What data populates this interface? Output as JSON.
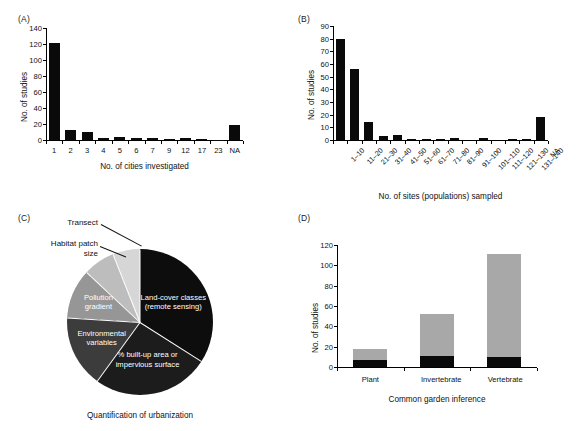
{
  "figure": {
    "panels": [
      "(A)",
      "(B)",
      "(C)",
      "(D)"
    ]
  },
  "chart_data": [
    {
      "panel": "(A)",
      "type": "bar",
      "title": "",
      "xlabel": "No. of cities investigated",
      "ylabel": "No. of studies",
      "ylim": [
        0,
        140
      ],
      "yticks": [
        0,
        20,
        40,
        60,
        80,
        100,
        120,
        140
      ],
      "categories": [
        "1",
        "2",
        "3",
        "4",
        "5",
        "6",
        "7",
        "9",
        "12",
        "17",
        "23",
        "NA"
      ],
      "values": [
        121,
        12,
        10,
        3,
        4,
        3,
        2,
        1,
        2,
        1,
        0.5,
        19
      ],
      "grid": false,
      "legend": "none",
      "bar_color": "#0a0a0a"
    },
    {
      "panel": "(B)",
      "type": "bar",
      "title": "",
      "xlabel": "No. of sites (populations) sampled",
      "ylabel": "No. of studies",
      "ylim": [
        0,
        90
      ],
      "yticks": [
        0,
        10,
        20,
        30,
        40,
        50,
        60,
        70,
        80,
        90
      ],
      "categories": [
        "1–10",
        "11–20",
        "21–30",
        "31–40",
        "41–50",
        "51–60",
        "61–70",
        "71–80",
        "81–90",
        "91–100",
        "101–110",
        "111–120",
        "121–130",
        "131–140",
        "NA"
      ],
      "values": [
        80,
        56,
        14,
        3,
        4,
        0.5,
        0.5,
        0.5,
        1.2,
        0,
        1.2,
        0,
        0.5,
        0.5,
        18
      ],
      "grid": false,
      "legend": "none",
      "bar_color": "#0a0a0a"
    },
    {
      "panel": "(C)",
      "type": "pie",
      "title": "",
      "caption": "Quantification of urbanization",
      "labels": [
        "Land-cover classes\n(remote sensing)",
        "% built-up area or\nimpervious surface",
        "Environmental\nvariables",
        "Pollution\ngradient",
        "Habitat patch\nsize",
        "Transect"
      ],
      "values": [
        34,
        26,
        16,
        11,
        7,
        6
      ],
      "colors": [
        "#0d0d0d",
        "#1c1c1c",
        "#3c3c3c",
        "#969696",
        "#bdbdbd",
        "#d6d6d6"
      ],
      "legend": "in-slice and callout"
    },
    {
      "panel": "(D)",
      "type": "bar",
      "stacked": true,
      "title": "",
      "xlabel": "Common garden inference",
      "ylabel": "No. of studies",
      "ylim": [
        0,
        120
      ],
      "yticks": [
        0,
        20,
        40,
        60,
        80,
        100,
        120
      ],
      "categories": [
        "Plant",
        "Invertebrate",
        "Vertebrate"
      ],
      "series": [
        {
          "name": "lower",
          "values": [
            7,
            11,
            10
          ],
          "color": "#0a0a0a"
        },
        {
          "name": "upper",
          "values": [
            11,
            41,
            101
          ],
          "color": "#a8a8a8"
        }
      ],
      "totals": [
        18,
        52,
        111
      ],
      "grid": false,
      "legend": "none"
    }
  ]
}
